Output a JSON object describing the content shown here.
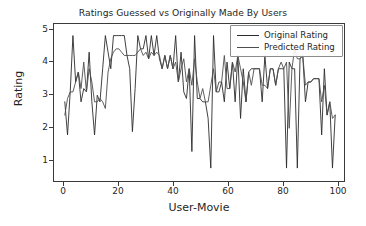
{
  "chart_data": {
    "type": "line",
    "title": "Ratings Guessed vs Originally Made By Users",
    "xlabel": "User-Movie",
    "ylabel": "Rating",
    "xlim": [
      -4,
      104
    ],
    "ylim": [
      0.55,
      5.35
    ],
    "xticks": [
      0,
      20,
      40,
      60,
      80,
      100
    ],
    "yticks": [
      1,
      2,
      3,
      4,
      5
    ],
    "grid": false,
    "legend_position": "upper right",
    "x": [
      0,
      1,
      2,
      3,
      4,
      5,
      6,
      7,
      8,
      9,
      10,
      11,
      12,
      13,
      14,
      15,
      16,
      17,
      18,
      19,
      20,
      21,
      22,
      23,
      24,
      25,
      26,
      27,
      28,
      29,
      30,
      31,
      32,
      33,
      34,
      35,
      36,
      37,
      38,
      39,
      40,
      41,
      42,
      43,
      44,
      45,
      46,
      47,
      48,
      49,
      50,
      51,
      52,
      53,
      54,
      55,
      56,
      57,
      58,
      59,
      60,
      61,
      62,
      63,
      64,
      65,
      66,
      67,
      68,
      69,
      70,
      71,
      72,
      73,
      74,
      75,
      76,
      77,
      78,
      79,
      80,
      81,
      82,
      83,
      84,
      85,
      86,
      87,
      88,
      89,
      90,
      91,
      92,
      93,
      94,
      95,
      96,
      97,
      98,
      99,
      100
    ],
    "series": [
      {
        "name": "Original Rating",
        "color": "#2b2b2b",
        "values": [
          3.0,
          2.0,
          3.3,
          5.0,
          3.6,
          3.9,
          3.0,
          3.4,
          3.3,
          4.5,
          3.0,
          2.0,
          3.2,
          3.0,
          4.0,
          5.0,
          4.5,
          4.0,
          5.0,
          5.0,
          5.0,
          5.0,
          5.0,
          4.4,
          4.0,
          2.1,
          3.4,
          5.0,
          4.6,
          4.6,
          5.0,
          4.3,
          5.0,
          4.4,
          5.0,
          4.3,
          4.0,
          4.4,
          4.0,
          4.4,
          4.0,
          5.0,
          3.6,
          4.5,
          3.3,
          3.1,
          4.0,
          1.5,
          5.0,
          3.1,
          3.1,
          3.0,
          3.0,
          2.5,
          1.0,
          5.0,
          3.3,
          3.3,
          3.6,
          3.0,
          4.2,
          3.4,
          4.2,
          3.0,
          4.4,
          2.5,
          4.0,
          3.0,
          3.9,
          4.0,
          4.0,
          4.0,
          4.0,
          3.0,
          4.4,
          3.4,
          4.0,
          4.0,
          3.5,
          4.0,
          4.0,
          4.0,
          1.0,
          4.2,
          4.0,
          4.0,
          1.0,
          4.3,
          4.4,
          3.0,
          3.6,
          3.6,
          3.7,
          3.7,
          3.7,
          2.0,
          4.0,
          2.6,
          3.0,
          1.0,
          2.6
        ],
        "linewidth": 0.9
      },
      {
        "name": "Predicted Rating",
        "color": "#4d4d4d",
        "values": [
          2.6,
          3.1,
          3.3,
          3.3,
          3.6,
          3.9,
          3.4,
          4.2,
          3.3,
          4.0,
          3.6,
          3.0,
          3.0,
          3.1,
          3.0,
          2.8,
          3.9,
          4.3,
          4.5,
          4.6,
          4.6,
          4.5,
          4.4,
          4.4,
          4.4,
          4.4,
          4.4,
          4.5,
          4.6,
          4.4,
          4.5,
          4.3,
          4.5,
          4.4,
          4.5,
          4.4,
          4.0,
          4.4,
          4.0,
          4.4,
          4.0,
          4.2,
          3.6,
          4.0,
          4.3,
          3.6,
          4.0,
          3.5,
          4.3,
          3.6,
          3.1,
          3.4,
          3.0,
          3.0,
          3.5,
          4.0,
          3.3,
          3.6,
          3.6,
          4.4,
          3.4,
          3.4,
          4.2,
          3.9,
          4.4,
          4.0,
          3.6,
          3.0,
          3.9,
          3.5,
          4.0,
          4.0,
          4.0,
          3.5,
          3.5,
          3.4,
          4.0,
          4.0,
          3.5,
          4.0,
          4.2,
          4.0,
          4.2,
          2.2,
          4.0,
          4.6,
          4.3,
          4.3,
          4.4,
          3.5,
          3.6,
          3.6,
          3.7,
          3.7,
          3.7,
          3.0,
          3.5,
          2.6,
          3.0,
          2.5,
          2.6
        ],
        "linewidth": 0.9
      }
    ]
  },
  "legend": {
    "items": [
      {
        "label": "Original Rating"
      },
      {
        "label": "Predicted Rating"
      }
    ]
  },
  "axes": {
    "xtick_labels": [
      "0",
      "20",
      "40",
      "60",
      "80",
      "100"
    ],
    "ytick_labels": [
      "5",
      "4",
      "3",
      "2",
      "1"
    ]
  }
}
